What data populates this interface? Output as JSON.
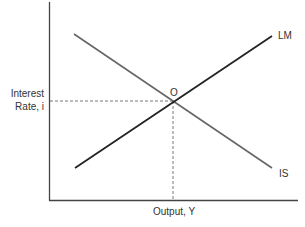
{
  "diagram": {
    "y_axis_label_line1": "Interest",
    "y_axis_label_line2": "Rate, i",
    "x_axis_label": "Output, Y",
    "equilibrium_label": "O",
    "curves": [
      {
        "name": "LM",
        "label": "LM",
        "slope": "upward",
        "color": "#222222"
      },
      {
        "name": "IS",
        "label": "IS",
        "slope": "downward",
        "color": "#666666"
      }
    ],
    "axis_color": "#333333",
    "guide_line_style": "dashed"
  }
}
